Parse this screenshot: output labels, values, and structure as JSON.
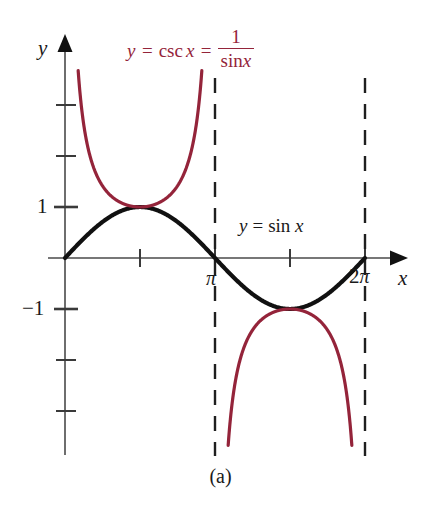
{
  "figure": {
    "caption": "(a)",
    "axis_labels": {
      "x": "x",
      "y": "y"
    },
    "labels": {
      "csc": {
        "lhs_var": "y",
        "equals_1": "=",
        "func": "csc",
        "func_arg": "x",
        "equals_2": "=",
        "numerator": "1",
        "denominator_func": "sin",
        "denominator_arg": "x",
        "full_text": "y = csc x = 1 / sin x",
        "color": "#94243a"
      },
      "sin": {
        "lhs_var": "y",
        "equals": "=",
        "func": "sin",
        "func_arg": "x",
        "full_text": "y = sin x",
        "color": "#111111"
      }
    },
    "ticks": {
      "x": [
        "π",
        "2π"
      ],
      "y": [
        "1",
        "−1"
      ]
    },
    "tick_pi": "π",
    "tick_2pi_coefficient": "2",
    "tick_2pi_symbol": "π",
    "tick_y_one": "1",
    "tick_y_neg_one": "−1"
  },
  "chart_data": {
    "type": "line",
    "title": "",
    "subtitle": "",
    "xlabel": "x",
    "ylabel": "y",
    "xlim": [
      -0.43,
      5.46
    ],
    "ylim": [
      -4.23,
      3.92
    ],
    "grid": false,
    "legend_position": "inline-annotations",
    "x_ticks": [
      1.5708,
      3.1416,
      4.7124,
      6.2832
    ],
    "x_tick_labels": [
      "",
      "π",
      "",
      "2π"
    ],
    "y_ticks": [
      -4,
      -3,
      -2,
      -1,
      1,
      2,
      3
    ],
    "y_tick_labels": [
      "",
      "",
      "",
      "−1",
      "1",
      "",
      ""
    ],
    "annotations": [
      {
        "text": "y = csc x = 1/sin x",
        "color": "#94243a",
        "x_px": 127,
        "y_px": 28
      },
      {
        "text": "y = sin x",
        "color": "#111111",
        "x_px": 239,
        "y_px": 216
      }
    ],
    "asymptotes": {
      "style": "dashed",
      "color": "#1a1a1a",
      "x_values": [
        3.1416,
        6.2832
      ]
    },
    "series": [
      {
        "name": "y = sin x",
        "color": "#111111",
        "style": "solid",
        "width_px": 4.2,
        "domain": [
          0,
          6.2832
        ],
        "key_points": [
          {
            "x": 0,
            "y": 0
          },
          {
            "x": 1.5708,
            "y": 1
          },
          {
            "x": 3.1416,
            "y": 0
          },
          {
            "x": 4.7124,
            "y": -1
          },
          {
            "x": 6.2832,
            "y": 0
          }
        ]
      },
      {
        "name": "y = csc x (branch 1)",
        "color": "#94243a",
        "style": "solid",
        "width_px": 3.2,
        "domain": [
          0.2756,
          2.866
        ],
        "key_points": [
          {
            "x": 0.2756,
            "y": 3.67
          },
          {
            "x": 1.5708,
            "y": 1
          },
          {
            "x": 2.866,
            "y": 3.67
          }
        ]
      },
      {
        "name": "y = csc x (branch 2)",
        "color": "#94243a",
        "style": "solid",
        "width_px": 3.2,
        "domain": [
          3.4172,
          6.0076
        ],
        "key_points": [
          {
            "x": 3.4172,
            "y": -3.67
          },
          {
            "x": 4.7124,
            "y": -1
          },
          {
            "x": 6.0076,
            "y": -3.67
          }
        ]
      }
    ]
  }
}
